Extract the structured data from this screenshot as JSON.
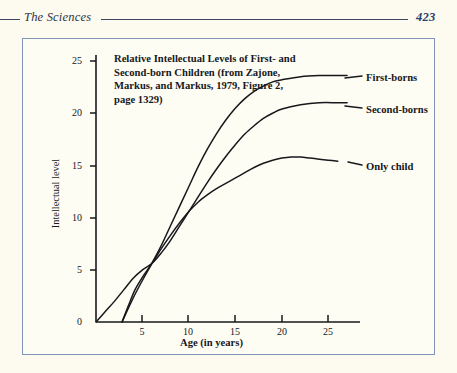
{
  "running_head": {
    "title": "The Sciences",
    "page_number": "423"
  },
  "chart_data": {
    "type": "line",
    "title": "Relative Intellectual Levels of First- and Second-born Children (from Zajone, Markus, and Markus, 1979, Figure 2, page 1329)",
    "xlabel": "Age (in years)",
    "ylabel": "Intellectual level",
    "xlim": [
      0,
      28
    ],
    "ylim": [
      0,
      27
    ],
    "xticks": [
      "5",
      "10",
      "15",
      "20",
      "25"
    ],
    "yticks": [
      "0",
      "5",
      "10",
      "15",
      "20",
      "25"
    ],
    "grid": false,
    "legend_position": "right-inline-labels",
    "series": [
      {
        "name": "First-borns",
        "label": "First-borns",
        "points": [
          [
            2.8,
            0.0
          ],
          [
            4.0,
            2.3
          ],
          [
            5.0,
            4.0
          ],
          [
            6.0,
            5.6
          ],
          [
            7.0,
            7.3
          ],
          [
            8.0,
            9.2
          ],
          [
            9.0,
            11.1
          ],
          [
            10.0,
            13.0
          ],
          [
            11.0,
            14.9
          ],
          [
            12.0,
            16.6
          ],
          [
            13.0,
            18.1
          ],
          [
            14.0,
            19.4
          ],
          [
            15.0,
            20.5
          ],
          [
            16.0,
            21.4
          ],
          [
            17.0,
            22.1
          ],
          [
            18.0,
            22.6
          ],
          [
            19.0,
            23.0
          ],
          [
            20.0,
            23.2
          ],
          [
            22.0,
            23.5
          ],
          [
            24.0,
            23.6
          ],
          [
            26.0,
            23.6
          ],
          [
            27.0,
            23.6
          ]
        ]
      },
      {
        "name": "Second-borns",
        "label": "Second-borns",
        "points": [
          [
            0.0,
            0.0
          ],
          [
            1.0,
            1.0
          ],
          [
            2.0,
            2.0
          ],
          [
            3.0,
            3.1
          ],
          [
            4.0,
            4.2
          ],
          [
            5.0,
            5.0
          ],
          [
            6.0,
            5.6
          ],
          [
            7.0,
            6.6
          ],
          [
            8.0,
            7.8
          ],
          [
            9.0,
            9.2
          ],
          [
            10.0,
            10.6
          ],
          [
            11.0,
            12.0
          ],
          [
            12.0,
            13.4
          ],
          [
            13.0,
            14.7
          ],
          [
            14.0,
            15.9
          ],
          [
            15.0,
            17.0
          ],
          [
            16.0,
            18.0
          ],
          [
            17.0,
            18.8
          ],
          [
            18.0,
            19.5
          ],
          [
            19.0,
            20.0
          ],
          [
            20.0,
            20.4
          ],
          [
            22.0,
            20.8
          ],
          [
            24.0,
            21.0
          ],
          [
            26.0,
            21.0
          ],
          [
            27.0,
            21.0
          ]
        ]
      },
      {
        "name": "Only child",
        "label": "Only child",
        "points": [
          [
            2.8,
            0.0
          ],
          [
            3.5,
            1.6
          ],
          [
            4.2,
            3.1
          ],
          [
            5.0,
            4.3
          ],
          [
            6.0,
            5.6
          ],
          [
            7.0,
            7.0
          ],
          [
            8.0,
            8.3
          ],
          [
            9.0,
            9.5
          ],
          [
            10.0,
            10.6
          ],
          [
            11.0,
            11.5
          ],
          [
            12.0,
            12.2
          ],
          [
            13.0,
            12.8
          ],
          [
            14.0,
            13.3
          ],
          [
            15.0,
            13.8
          ],
          [
            16.0,
            14.3
          ],
          [
            17.0,
            14.8
          ],
          [
            18.0,
            15.2
          ],
          [
            19.0,
            15.5
          ],
          [
            20.0,
            15.7
          ],
          [
            21.0,
            15.8
          ],
          [
            22.0,
            15.8
          ],
          [
            23.0,
            15.7
          ],
          [
            24.0,
            15.6
          ],
          [
            25.0,
            15.5
          ],
          [
            26.0,
            15.4
          ]
        ]
      }
    ],
    "annotations": [
      {
        "text": "curves intersect near age 6 at level 5.5"
      }
    ],
    "colors": {
      "curve": "#16181c",
      "axis": "#16181c",
      "frame": "#8193b8",
      "background": "#fefdf4"
    }
  }
}
